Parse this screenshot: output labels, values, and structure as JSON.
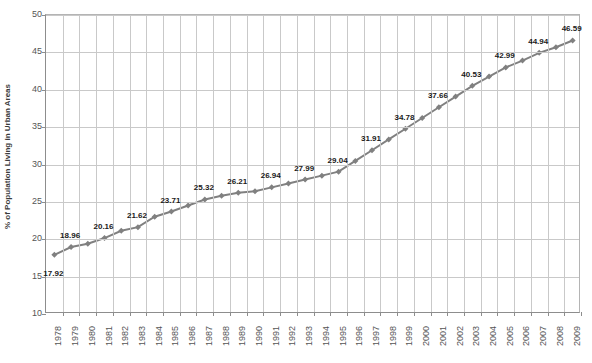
{
  "chart_data": {
    "type": "line",
    "title": "",
    "xlabel": "",
    "ylabel": "% of Population Living in Urban Areas",
    "ylim": [
      10,
      50
    ],
    "ytick_step": 5,
    "yticks": [
      "50",
      "45",
      "40",
      "35",
      "30",
      "25",
      "20",
      "15",
      "10"
    ],
    "grid": true,
    "legend": "none",
    "series_color": "#808080",
    "marker": "diamond",
    "categories": [
      "1978",
      "1979",
      "1980",
      "1981",
      "1982",
      "1983",
      "1984",
      "1985",
      "1986",
      "1987",
      "1988",
      "1989",
      "1990",
      "1991",
      "1992",
      "1993",
      "1994",
      "1995",
      "1996",
      "1997",
      "1998",
      "1999",
      "2000",
      "2001",
      "2002",
      "2003",
      "2004",
      "2005",
      "2006",
      "2007",
      "2008",
      "2009"
    ],
    "values": [
      17.92,
      18.96,
      19.39,
      20.16,
      21.13,
      21.62,
      23.01,
      23.71,
      24.52,
      25.32,
      25.81,
      26.21,
      26.41,
      26.94,
      27.46,
      27.99,
      28.51,
      29.04,
      30.48,
      31.91,
      33.35,
      34.78,
      36.22,
      37.66,
      39.09,
      40.53,
      41.76,
      42.99,
      43.9,
      44.94,
      45.68,
      46.59
    ],
    "labeled_points": [
      {
        "year": "1978",
        "value": 17.92,
        "label": "17.92",
        "position": "below"
      },
      {
        "year": "1979",
        "value": 18.96,
        "label": "18.96",
        "position": "above"
      },
      {
        "year": "1981",
        "value": 20.16,
        "label": "20.16",
        "position": "above"
      },
      {
        "year": "1983",
        "value": 21.62,
        "label": "21.62",
        "position": "above"
      },
      {
        "year": "1985",
        "value": 23.71,
        "label": "23.71",
        "position": "above"
      },
      {
        "year": "1987",
        "value": 25.32,
        "label": "25.32",
        "position": "above"
      },
      {
        "year": "1989",
        "value": 26.21,
        "label": "26.21",
        "position": "above"
      },
      {
        "year": "1991",
        "value": 26.94,
        "label": "26.94",
        "position": "above"
      },
      {
        "year": "1993",
        "value": 27.99,
        "label": "27.99",
        "position": "above"
      },
      {
        "year": "1995",
        "value": 29.04,
        "label": "29.04",
        "position": "above"
      },
      {
        "year": "1997",
        "value": 31.91,
        "label": "31.91",
        "position": "above"
      },
      {
        "year": "1999",
        "value": 34.78,
        "label": "34.78",
        "position": "above"
      },
      {
        "year": "2001",
        "value": 37.66,
        "label": "37.66",
        "position": "above"
      },
      {
        "year": "2003",
        "value": 40.53,
        "label": "40.53",
        "position": "above"
      },
      {
        "year": "2005",
        "value": 42.99,
        "label": "42.99",
        "position": "above"
      },
      {
        "year": "2007",
        "value": 44.94,
        "label": "44.94",
        "position": "above"
      },
      {
        "year": "2009",
        "value": 46.59,
        "label": "46.59",
        "position": "above"
      }
    ]
  }
}
